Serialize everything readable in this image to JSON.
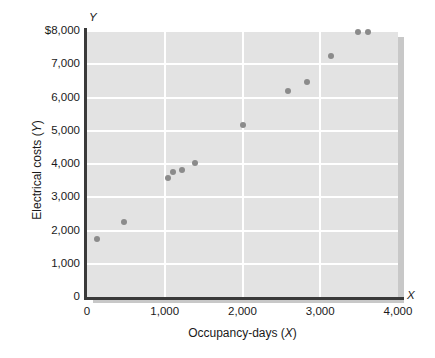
{
  "chart_data": {
    "type": "scatter",
    "title": "",
    "xlabel": "Occupancy-days (X)",
    "ylabel": "Electrical costs (Y)",
    "axis_letter_x": "X",
    "axis_letter_y": "Y",
    "xlim": [
      0,
      4000
    ],
    "ylim": [
      0,
      8000
    ],
    "grid": true,
    "legend": "none",
    "xticks": [
      0,
      1000,
      2000,
      3000,
      4000
    ],
    "xtick_labels": [
      "0",
      "1,000",
      "2,000",
      "3,000",
      "4,000"
    ],
    "yticks": [
      0,
      1000,
      2000,
      3000,
      4000,
      5000,
      6000,
      7000,
      8000
    ],
    "ytick_labels": [
      "0",
      "1,000",
      "2,000",
      "3,000",
      "4,000",
      "5,000",
      "6,000",
      "7,000",
      "$8,000"
    ],
    "x": [
      130,
      475,
      1040,
      1105,
      1220,
      1390,
      2005,
      2585,
      2830,
      3140,
      3485,
      3615
    ],
    "y": [
      1750,
      2250,
      3575,
      3760,
      3820,
      4030,
      5175,
      6195,
      6465,
      7250,
      7975,
      7975
    ],
    "points": [
      {
        "x": 130,
        "y": 1750
      },
      {
        "x": 475,
        "y": 2250
      },
      {
        "x": 1040,
        "y": 3575
      },
      {
        "x": 1105,
        "y": 3760
      },
      {
        "x": 1220,
        "y": 3820
      },
      {
        "x": 1390,
        "y": 4030
      },
      {
        "x": 2005,
        "y": 5175
      },
      {
        "x": 2585,
        "y": 6195
      },
      {
        "x": 2830,
        "y": 6465
      },
      {
        "x": 3140,
        "y": 7250
      },
      {
        "x": 3485,
        "y": 7975
      },
      {
        "x": 3615,
        "y": 7975
      }
    ],
    "colors": {
      "plot_background": "#e3e3e3",
      "gridline": "#ffffff",
      "point": "#8b8b8b",
      "axis": "#3a3a3a",
      "text": "#1a1a1a",
      "shadow": "#c8c8c8"
    }
  }
}
